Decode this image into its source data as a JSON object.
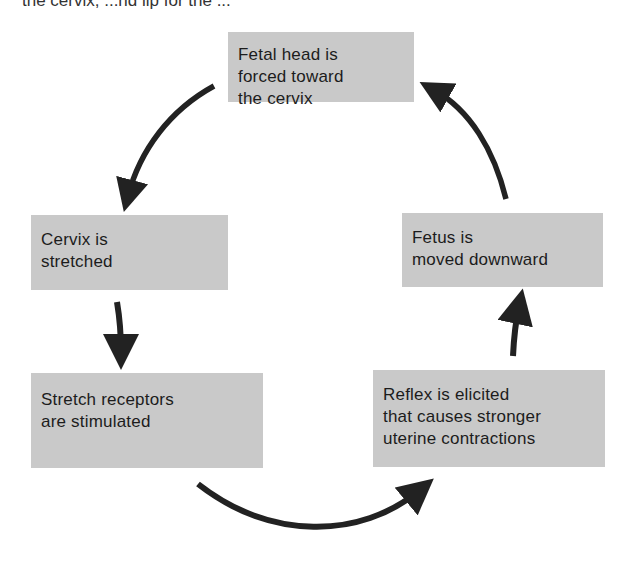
{
  "header": {
    "cut_text": "the cervix, ...nd lip for the ..."
  },
  "nodes": [
    {
      "id": "fetal-head",
      "lines": [
        "Fetal head is",
        "forced toward",
        "the cervix"
      ]
    },
    {
      "id": "cervix",
      "lines": [
        "Cervix is",
        "stretched"
      ]
    },
    {
      "id": "stretch",
      "lines": [
        "Stretch receptors",
        "are stimulated"
      ]
    },
    {
      "id": "reflex",
      "lines": [
        "Reflex is elicited",
        "that causes stronger",
        "uterine contractions"
      ]
    },
    {
      "id": "fetus",
      "lines": [
        "Fetus is",
        "moved downward"
      ]
    }
  ],
  "edges": [
    {
      "from": "fetal-head",
      "to": "cervix"
    },
    {
      "from": "cervix",
      "to": "stretch"
    },
    {
      "from": "stretch",
      "to": "reflex"
    },
    {
      "from": "reflex",
      "to": "fetus"
    },
    {
      "from": "fetus",
      "to": "fetal-head"
    }
  ],
  "colors": {
    "box": "#c9c9c9",
    "arrow": "#222222",
    "text": "#1c1c1c"
  }
}
